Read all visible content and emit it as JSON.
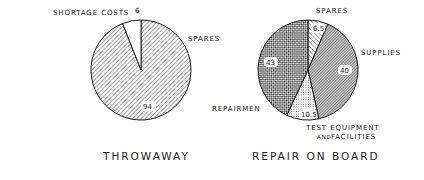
{
  "chart_data": [
    {
      "type": "pie",
      "title": "THROWAWAY",
      "center": [
        141,
        70
      ],
      "radius": 50,
      "start_angle_deg": 0,
      "direction": "clockwise",
      "slices": [
        {
          "label": "SPARES",
          "value": 94,
          "value_label": "94",
          "pattern": "diag-fine"
        },
        {
          "label": "SHORTAGE COSTS",
          "value": 6,
          "value_label": "6",
          "pattern": "none"
        }
      ]
    },
    {
      "type": "pie",
      "title": "REPAIR ON BOARD",
      "center": [
        308,
        70
      ],
      "radius": 50,
      "start_angle_deg": 0,
      "direction": "clockwise",
      "slices": [
        {
          "label": "SPARES",
          "value": 6.5,
          "value_label": "6.5",
          "pattern": "diag-sparse"
        },
        {
          "label": "SUPPLIES",
          "value": 40,
          "value_label": "40",
          "pattern": "diag-dense"
        },
        {
          "label": "TEST EQUIPMENT AND FACILITIES",
          "value": 10.5,
          "value_label": "10.5",
          "pattern": "dots"
        },
        {
          "label": "REPAIRMEN",
          "value": 43,
          "value_label": "43",
          "pattern": "checker"
        }
      ]
    }
  ],
  "labels": {
    "left": {
      "shortage": "SHORTAGE COSTS",
      "spares": "SPARES",
      "v_spares": "94",
      "v_shortage": "6",
      "title": "THROWAWAY"
    },
    "right": {
      "spares": "SPARES",
      "supplies": "SUPPLIES",
      "test1": "TEST EQUIPMENT",
      "test2_and": "AND",
      "test2_fac": "FACILITIES",
      "repairmen": "REPAIRMEN",
      "v_spares": "6.5",
      "v_supplies": "40",
      "v_test": "10.5",
      "v_repairmen": "43",
      "title": "REPAIR ON BOARD"
    }
  },
  "colors": {
    "ink": "#1a1a1a",
    "background": "#ffffff"
  }
}
